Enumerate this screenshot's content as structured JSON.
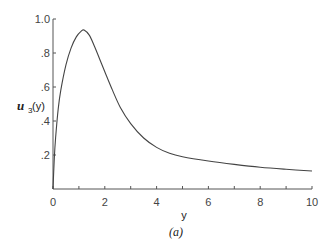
{
  "chart_data": {
    "type": "line",
    "title": "",
    "caption": "(a)",
    "xlabel": "y",
    "ylabel": "u3(y)",
    "ylabel_main": "u",
    "ylabel_sub": "3",
    "ylabel_arg": "(y)",
    "xlim": [
      0,
      10
    ],
    "ylim": [
      0,
      1.0
    ],
    "grid": false,
    "legend": null,
    "x_ticks": [
      0,
      1,
      2,
      3,
      4,
      5,
      6,
      7,
      8,
      9,
      10
    ],
    "x_tick_labels": [
      {
        "value": 0,
        "label": "0"
      },
      {
        "value": 2,
        "label": "2"
      },
      {
        "value": 4,
        "label": "4"
      },
      {
        "value": 6,
        "label": "6"
      },
      {
        "value": 8,
        "label": "8"
      },
      {
        "value": 10,
        "label": "10"
      }
    ],
    "y_tick_labels": [
      {
        "value": 0.2,
        "label": ".2"
      },
      {
        "value": 0.4,
        "label": ".4"
      },
      {
        "value": 0.6,
        "label": ".6"
      },
      {
        "value": 0.8,
        "label": ".8"
      },
      {
        "value": 1.0,
        "label": "1.0"
      }
    ],
    "series": [
      {
        "name": "u3(y)",
        "x": [
          0,
          0.05,
          0.1,
          0.2,
          0.3,
          0.5,
          0.7,
          0.9,
          1.1,
          1.2,
          1.4,
          1.6,
          1.8,
          2.0,
          2.3,
          2.6,
          3.0,
          3.5,
          4.0,
          4.5,
          5.0,
          6.0,
          7.0,
          8.0,
          9.0,
          10.0
        ],
        "values": [
          0,
          0.18,
          0.3,
          0.47,
          0.58,
          0.73,
          0.83,
          0.895,
          0.93,
          0.935,
          0.905,
          0.84,
          0.765,
          0.69,
          0.58,
          0.48,
          0.385,
          0.3,
          0.245,
          0.21,
          0.19,
          0.165,
          0.145,
          0.128,
          0.116,
          0.106
        ]
      }
    ]
  }
}
